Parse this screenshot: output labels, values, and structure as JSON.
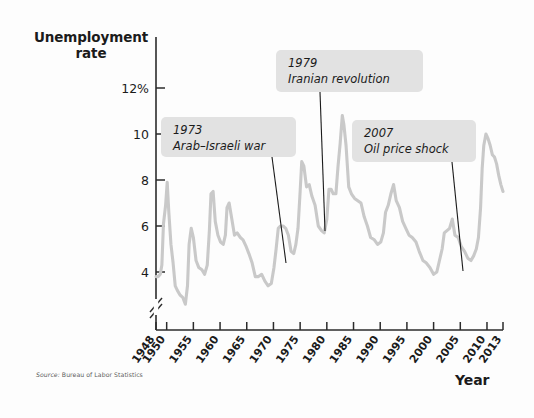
{
  "chart_data": {
    "type": "line",
    "title": "",
    "ylabel_line1": "Unemployment",
    "ylabel_line2": "rate",
    "xlabel": "Year",
    "source": "Source: Bureau of Labor Statistics",
    "source_prefix": "Source:",
    "source_body": " Bureau of Labor Statistics",
    "series_color": "#c9c9c9",
    "axis_color": "#2b2b2b",
    "callout_bg": "#e2e2e2",
    "grid": false,
    "legend": "none",
    "axis_break": true,
    "xlim": [
      1948,
      2013
    ],
    "ylim": [
      3.0,
      12.8
    ],
    "ytick_values": [
      12,
      10,
      8,
      6,
      4
    ],
    "ytick_labels": [
      "12%",
      "10",
      "8",
      "6",
      "4"
    ],
    "xtick_values": [
      1948,
      1950,
      1955,
      1960,
      1965,
      1970,
      1975,
      1980,
      1985,
      1990,
      1995,
      2000,
      2005,
      2010,
      2013
    ],
    "xtick_labels": [
      "1948",
      "1950",
      "1955",
      "1960",
      "1965",
      "1970",
      "1975",
      "1980",
      "1985",
      "1990",
      "1995",
      "2000",
      "2005",
      "2010",
      "2013"
    ],
    "x": [
      1948.0,
      1948.4,
      1948.8,
      1949.1,
      1949.4,
      1949.8,
      1950.1,
      1950.4,
      1950.8,
      1951.2,
      1951.6,
      1952.0,
      1952.5,
      1953.0,
      1953.5,
      1953.9,
      1954.2,
      1954.6,
      1955.0,
      1955.5,
      1956.0,
      1956.6,
      1957.1,
      1957.6,
      1958.0,
      1958.3,
      1958.7,
      1959.1,
      1959.6,
      1960.1,
      1960.6,
      1961.0,
      1961.3,
      1961.7,
      1962.2,
      1962.7,
      1963.2,
      1963.8,
      1964.3,
      1964.9,
      1965.4,
      1966.0,
      1966.6,
      1967.2,
      1967.8,
      1968.4,
      1969.0,
      1969.6,
      1970.1,
      1970.5,
      1970.9,
      1971.3,
      1971.8,
      1972.3,
      1972.8,
      1973.3,
      1973.8,
      1974.2,
      1974.6,
      1975.0,
      1975.3,
      1975.7,
      1976.2,
      1976.7,
      1977.2,
      1977.8,
      1978.4,
      1979.0,
      1979.5,
      1980.0,
      1980.4,
      1980.8,
      1981.2,
      1981.7,
      1982.1,
      1982.5,
      1982.9,
      1983.2,
      1983.6,
      1984.1,
      1984.6,
      1985.2,
      1985.8,
      1986.4,
      1987.0,
      1987.6,
      1988.2,
      1988.9,
      1989.5,
      1990.1,
      1990.6,
      1991.0,
      1991.5,
      1992.0,
      1992.5,
      1993.0,
      1993.6,
      1994.2,
      1994.8,
      1995.4,
      1996.0,
      1996.7,
      1997.3,
      1998.0,
      1998.6,
      1999.3,
      2000.0,
      2000.6,
      2001.1,
      2001.6,
      2002.0,
      2002.5,
      2003.0,
      2003.5,
      2004.0,
      2004.6,
      2005.2,
      2005.8,
      2006.4,
      2007.0,
      2007.5,
      2008.0,
      2008.4,
      2008.8,
      2009.1,
      2009.4,
      2009.8,
      2010.2,
      2010.6,
      2011.0,
      2011.4,
      2011.8,
      2012.2,
      2012.6,
      2013.0
    ],
    "y": [
      3.8,
      3.8,
      3.9,
      4.3,
      6.1,
      6.9,
      7.9,
      6.6,
      5.2,
      4.4,
      3.4,
      3.2,
      3.0,
      2.9,
      2.6,
      3.4,
      5.2,
      5.9,
      5.5,
      4.5,
      4.2,
      4.1,
      3.9,
      4.3,
      5.8,
      7.4,
      7.5,
      6.2,
      5.6,
      5.3,
      5.2,
      5.6,
      6.8,
      7.0,
      6.3,
      5.6,
      5.7,
      5.5,
      5.4,
      5.1,
      4.8,
      4.4,
      3.8,
      3.8,
      3.9,
      3.6,
      3.4,
      3.5,
      4.2,
      5.0,
      5.9,
      6.0,
      6.0,
      5.9,
      5.6,
      4.9,
      4.8,
      5.2,
      5.9,
      7.5,
      8.8,
      8.6,
      7.7,
      7.8,
      7.3,
      6.9,
      6.0,
      5.8,
      5.7,
      6.3,
      7.6,
      7.6,
      7.4,
      7.4,
      8.6,
      9.6,
      10.8,
      10.4,
      9.5,
      7.7,
      7.4,
      7.2,
      7.1,
      7.0,
      6.4,
      6.0,
      5.5,
      5.4,
      5.2,
      5.3,
      5.7,
      6.6,
      6.9,
      7.4,
      7.8,
      7.1,
      6.8,
      6.2,
      5.9,
      5.6,
      5.5,
      5.3,
      4.9,
      4.5,
      4.4,
      4.2,
      3.9,
      4.0,
      4.5,
      5.0,
      5.7,
      5.8,
      5.9,
      6.3,
      5.6,
      5.5,
      5.1,
      4.9,
      4.6,
      4.5,
      4.7,
      5.0,
      5.5,
      6.8,
      8.5,
      9.5,
      10.0,
      9.8,
      9.5,
      9.1,
      9.0,
      8.7,
      8.2,
      7.8,
      7.5,
      6.6
    ],
    "annotations": [
      {
        "id": "arab-israeli-war",
        "year": "1973",
        "text": "Arab–Israeli war",
        "box_x": 161,
        "box_y": 117,
        "box_w": 135,
        "box_h": 40,
        "line_x1": 272,
        "line_y1": 157,
        "line_x2": 286,
        "line_y2": 263
      },
      {
        "id": "iranian-revolution",
        "year": "1979",
        "text": "Iranian revolution",
        "box_x": 276,
        "box_y": 50,
        "box_w": 147,
        "box_h": 42,
        "line_x1": 320,
        "line_y1": 92,
        "line_x2": 325,
        "line_y2": 231
      },
      {
        "id": "oil-price-shock",
        "year": "2007",
        "text": "Oil price shock",
        "box_x": 352,
        "box_y": 120,
        "box_w": 124,
        "box_h": 42,
        "line_x1": 452,
        "line_y1": 162,
        "line_x2": 463,
        "line_y2": 271
      }
    ]
  },
  "geometry": {
    "plot_left": 156,
    "plot_right": 503,
    "plot_top": 37,
    "plot_bottom": 330,
    "y_at_12": 88,
    "y_at_4": 272
  }
}
